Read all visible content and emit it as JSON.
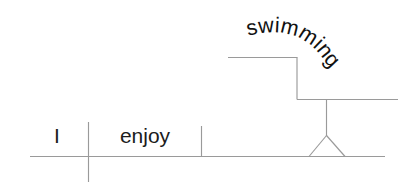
{
  "diagram": {
    "type": "reed-kellogg-sentence-diagram",
    "sentence": "I enjoy swimming.",
    "background_color": "#ffffff",
    "line_color": "#9a9a9a",
    "text_color": "#1c1c1c",
    "words": {
      "subject": "I",
      "verb": "enjoy",
      "direct_object": "swimming"
    },
    "labels": {
      "subject_label": "I",
      "verb_label": "enjoy",
      "object_label": "swimming"
    },
    "parts": {
      "baseline": "main-horizontal-baseline",
      "subject_verb_divider": "vertical-line-crossing-baseline",
      "verb_object_divider": "short-vertical-line-above-baseline",
      "gerund_stand": "triangle-pedestal",
      "gerund_step_line": "stepped-line-for-gerund"
    }
  }
}
